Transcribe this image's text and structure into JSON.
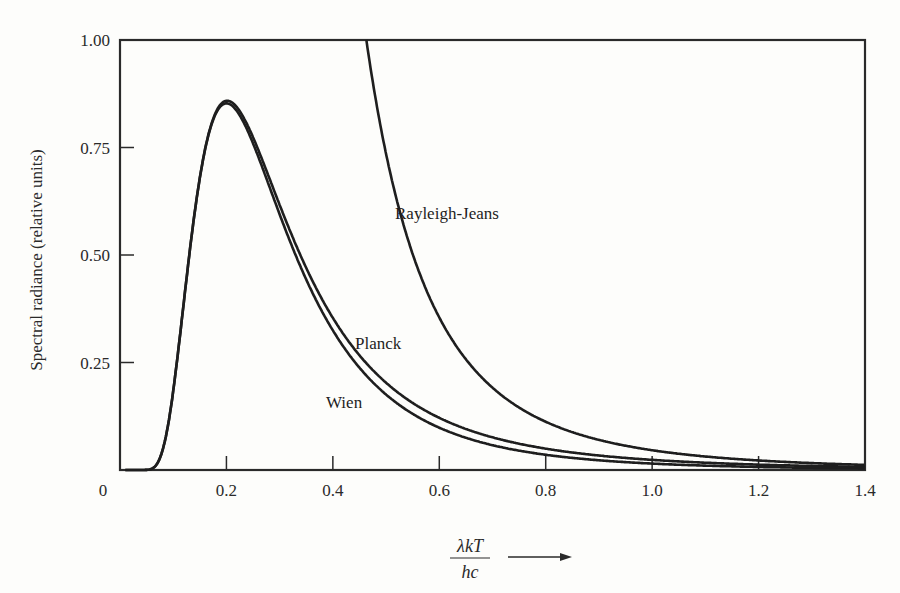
{
  "chart_data": {
    "type": "line",
    "title": "",
    "xlabel": "λkT/hc",
    "xlabel_numerator": "λkT",
    "xlabel_denominator": "hc",
    "ylabel": "Spectral radiance (relative units)",
    "xlim": [
      0,
      1.4
    ],
    "ylim": [
      0,
      1.0
    ],
    "grid": false,
    "legend": "inline labels",
    "x_ticks": [
      0.2,
      0.4,
      0.6,
      0.8,
      1.0,
      1.2,
      1.4
    ],
    "x_tick_labels": [
      "0",
      "0.2",
      "0.4",
      "0.6",
      "0.8",
      "1.0",
      "1.2",
      "1.4"
    ],
    "y_ticks": [
      0.25,
      0.5,
      0.75,
      1.0
    ],
    "y_tick_labels": [
      "0.25",
      "0.50",
      "0.75",
      "1.00"
    ],
    "origin_label": "0",
    "series": [
      {
        "name": "Planck",
        "x": [
          0.05,
          0.1,
          0.15,
          0.2,
          0.25,
          0.3,
          0.4,
          0.5,
          0.6,
          0.8,
          1.0,
          1.2,
          1.4
        ],
        "values": [
          0.0,
          0.06,
          0.54,
          0.86,
          0.73,
          0.55,
          0.35,
          0.23,
          0.15,
          0.07,
          0.04,
          0.02,
          0.01
        ]
      },
      {
        "name": "Wien",
        "x": [
          0.05,
          0.1,
          0.15,
          0.2,
          0.25,
          0.3,
          0.4,
          0.5,
          0.6,
          0.8,
          1.0,
          1.2,
          1.4
        ],
        "values": [
          0.0,
          0.06,
          0.54,
          0.86,
          0.72,
          0.53,
          0.32,
          0.2,
          0.12,
          0.05,
          0.02,
          0.01,
          0.005
        ]
      },
      {
        "name": "Rayleigh-Jeans",
        "x": [
          0.46,
          0.5,
          0.6,
          0.7,
          0.8,
          1.0,
          1.2,
          1.4
        ],
        "values": [
          1.0,
          0.72,
          0.35,
          0.19,
          0.11,
          0.05,
          0.02,
          0.01
        ]
      }
    ]
  },
  "labels": {
    "planck": "Planck",
    "wien": "Wien",
    "rayleigh_jeans": "Rayleigh-Jeans"
  }
}
